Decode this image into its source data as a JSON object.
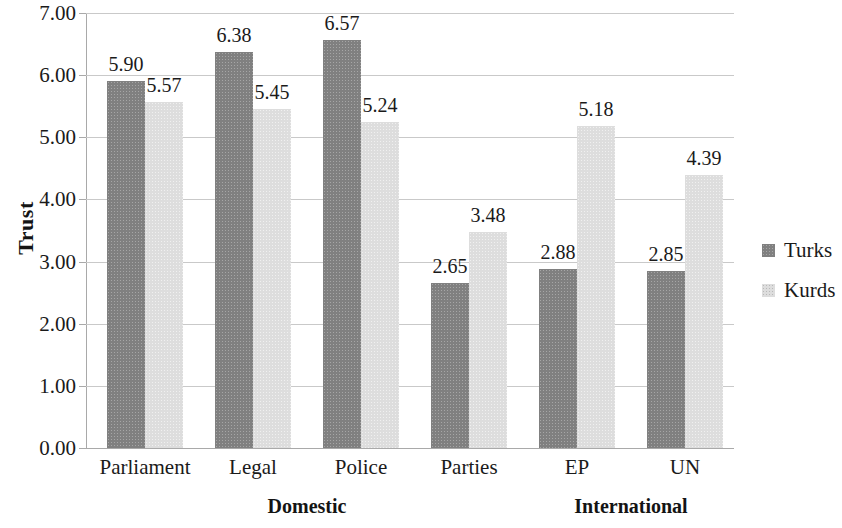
{
  "chart_data": {
    "type": "bar",
    "title": "",
    "subtitle": "",
    "xlabel": "",
    "ylabel": "Trust",
    "ylim": [
      0,
      7
    ],
    "ytick_step": 1,
    "ytick_labels": [
      "0.00",
      "1.00",
      "2.00",
      "3.00",
      "4.00",
      "5.00",
      "6.00",
      "7.00"
    ],
    "grid": true,
    "legend_position": "right",
    "categories": [
      "Parliament",
      "Legal",
      "Police",
      "Parties",
      "EP",
      "UN"
    ],
    "group_labels": [
      {
        "label": "Domestic",
        "categories": [
          "Parliament",
          "Legal",
          "Police",
          "Parties"
        ]
      },
      {
        "label": "International",
        "categories": [
          "EP",
          "UN"
        ]
      }
    ],
    "series": [
      {
        "name": "Turks",
        "color": "#808080",
        "values": [
          5.9,
          6.38,
          6.57,
          2.65,
          2.88,
          2.85
        ],
        "value_labels": [
          "5.90",
          "6.38",
          "6.57",
          "2.65",
          "2.88",
          "2.85"
        ]
      },
      {
        "name": "Kurds",
        "color": "#dddddd",
        "values": [
          5.57,
          5.45,
          5.24,
          3.48,
          5.18,
          4.39
        ],
        "value_labels": [
          "5.57",
          "5.45",
          "5.24",
          "3.48",
          "5.18",
          "4.39"
        ]
      }
    ]
  },
  "legend": {
    "entries": [
      {
        "label": "Turks",
        "swatch": "turks"
      },
      {
        "label": "Kurds",
        "swatch": "kurds"
      }
    ]
  },
  "axis": {
    "y_title": "Trust"
  },
  "colors": {
    "turks": "#808080",
    "kurds": "#dddddd",
    "gridline": "#c9c9c9",
    "axis": "#a9a9a9",
    "text": "#1a1a1a"
  }
}
